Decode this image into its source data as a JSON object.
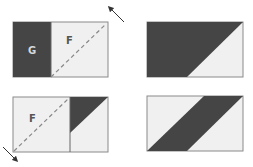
{
  "colors": {
    "dark": "#454545",
    "light": "#f0f0f0",
    "border": "#8a8a8a",
    "divider": "#666666",
    "dash": "#888888",
    "arrow": "#333333",
    "label_on_dark": "#d8d8d8",
    "label_on_light": "#555555"
  },
  "panels": [
    {
      "id": "top-left",
      "labels": [
        {
          "text": "G",
          "region": "dark-left"
        },
        {
          "text": "F",
          "region": "light-right"
        }
      ],
      "fold_arrow": "up-right"
    },
    {
      "id": "top-right",
      "labels": []
    },
    {
      "id": "bottom-left",
      "labels": [
        {
          "text": "F",
          "region": "light-left"
        }
      ],
      "fold_arrow": "down-left"
    },
    {
      "id": "bottom-right",
      "labels": []
    }
  ],
  "labels": {
    "g": "G",
    "f_top": "F",
    "f_bottom": "F"
  }
}
